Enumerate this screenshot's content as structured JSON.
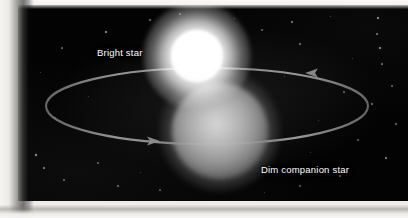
{
  "figure": {
    "type": "astronomy-diagram",
    "width": 408,
    "height": 218,
    "background_color": "#030303",
    "page_color": "#f2f1ef"
  },
  "labels": {
    "bright_star": "Bright star",
    "dim_star": "Dim companion star",
    "text_color": "#ffffff"
  },
  "bodies": {
    "bright_star": {
      "name": "bright-star",
      "center_x": 197,
      "center_y": 56,
      "core_radius": 26,
      "halo_radius": 54,
      "core_color": "#ffffff",
      "halo_color": "#e6e6e6"
    },
    "dim_star": {
      "name": "dim-companion-star",
      "center_x": 220,
      "center_y": 131,
      "core_radius": 48,
      "halo_radius": 60,
      "core_color": "#b4b4b4",
      "halo_color": "#6e6e6e"
    }
  },
  "orbit": {
    "name": "orbital-path",
    "center_x": 207,
    "center_y": 106,
    "radius_x": 161,
    "radius_y": 38,
    "stroke_color": "#8e8e8e",
    "stroke_width": 2.1,
    "arrows": [
      {
        "name": "orbit-arrow-bottom-left",
        "x": 147,
        "y": 141,
        "direction": "right"
      },
      {
        "name": "orbit-arrow-top-right",
        "x": 318,
        "y": 73,
        "direction": "left"
      }
    ]
  },
  "starfield": {
    "color": "#ffffff",
    "dots": [
      {
        "x": 106,
        "y": 32,
        "r": 0.7,
        "o": 0.55
      },
      {
        "x": 150,
        "y": 20,
        "r": 0.6,
        "o": 0.4
      },
      {
        "x": 62,
        "y": 48,
        "r": 0.6,
        "o": 0.35
      },
      {
        "x": 40,
        "y": 72,
        "r": 0.5,
        "o": 0.3
      },
      {
        "x": 88,
        "y": 96,
        "r": 0.5,
        "o": 0.28
      },
      {
        "x": 55,
        "y": 118,
        "r": 0.6,
        "o": 0.32
      },
      {
        "x": 36,
        "y": 155,
        "r": 0.9,
        "o": 0.62
      },
      {
        "x": 44,
        "y": 168,
        "r": 0.7,
        "o": 0.45
      },
      {
        "x": 64,
        "y": 180,
        "r": 0.6,
        "o": 0.35
      },
      {
        "x": 98,
        "y": 163,
        "r": 0.6,
        "o": 0.33
      },
      {
        "x": 118,
        "y": 186,
        "r": 0.7,
        "o": 0.4
      },
      {
        "x": 140,
        "y": 172,
        "r": 0.5,
        "o": 0.26
      },
      {
        "x": 160,
        "y": 190,
        "r": 0.6,
        "o": 0.3
      },
      {
        "x": 180,
        "y": 14,
        "r": 0.6,
        "o": 0.35
      },
      {
        "x": 234,
        "y": 18,
        "r": 0.5,
        "o": 0.28
      },
      {
        "x": 262,
        "y": 30,
        "r": 0.6,
        "o": 0.32
      },
      {
        "x": 292,
        "y": 22,
        "r": 0.7,
        "o": 0.45
      },
      {
        "x": 300,
        "y": 44,
        "r": 0.6,
        "o": 0.38
      },
      {
        "x": 330,
        "y": 16,
        "r": 0.5,
        "o": 0.3
      },
      {
        "x": 378,
        "y": 18,
        "r": 0.9,
        "o": 0.6
      },
      {
        "x": 377,
        "y": 34,
        "r": 0.6,
        "o": 0.4
      },
      {
        "x": 380,
        "y": 48,
        "r": 0.9,
        "o": 0.58
      },
      {
        "x": 382,
        "y": 64,
        "r": 0.6,
        "o": 0.36
      },
      {
        "x": 352,
        "y": 58,
        "r": 0.5,
        "o": 0.26
      },
      {
        "x": 344,
        "y": 92,
        "r": 0.6,
        "o": 0.34
      },
      {
        "x": 372,
        "y": 104,
        "r": 0.7,
        "o": 0.42
      },
      {
        "x": 392,
        "y": 86,
        "r": 0.6,
        "o": 0.33
      },
      {
        "x": 396,
        "y": 124,
        "r": 0.7,
        "o": 0.4
      },
      {
        "x": 358,
        "y": 140,
        "r": 0.6,
        "o": 0.32
      },
      {
        "x": 386,
        "y": 158,
        "r": 0.8,
        "o": 0.5
      },
      {
        "x": 340,
        "y": 176,
        "r": 0.6,
        "o": 0.33
      },
      {
        "x": 310,
        "y": 152,
        "r": 0.5,
        "o": 0.26
      },
      {
        "x": 300,
        "y": 186,
        "r": 0.6,
        "o": 0.3
      },
      {
        "x": 264,
        "y": 192,
        "r": 0.5,
        "o": 0.25
      },
      {
        "x": 318,
        "y": 120,
        "r": 0.5,
        "o": 0.24
      },
      {
        "x": 284,
        "y": 76,
        "r": 0.5,
        "o": 0.28
      }
    ]
  }
}
